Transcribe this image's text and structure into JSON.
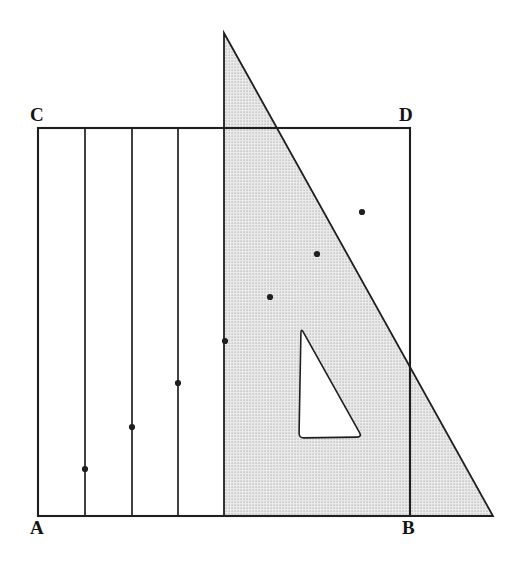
{
  "figure": {
    "background_color": "#ffffff",
    "line_color": "#1f1f1f",
    "shade_avg_color": "#dcdcdc",
    "rectangle": {
      "x1": 38,
      "y1": 128,
      "x2": 410,
      "y2": 516
    },
    "vertical_lines_x": [
      85,
      132,
      178
    ],
    "set_square": {
      "apex": [
        224,
        33
      ],
      "bottom_left": [
        224,
        516
      ],
      "bottom_right": [
        493,
        516
      ],
      "cutout": {
        "top": [
          301,
          328
        ],
        "bottom_left": [
          299,
          438
        ],
        "bottom_right": [
          362,
          437
        ],
        "corner_radius": 5
      }
    },
    "dots": [
      [
        85,
        469
      ],
      [
        132,
        427
      ],
      [
        178,
        383
      ],
      [
        225,
        341
      ],
      [
        270,
        297
      ],
      [
        317,
        254
      ],
      [
        362,
        212
      ]
    ],
    "dot_radius": 3.1,
    "stroke_widths": {
      "rectangle": 2.1,
      "vertical_line": 1.7,
      "set_square": 1.8,
      "cutout": 1.6
    },
    "labels": {
      "C": {
        "text": "C",
        "x": 30,
        "y": 105
      },
      "D": {
        "text": "D",
        "x": 399,
        "y": 105
      },
      "A": {
        "text": "A",
        "x": 30,
        "y": 518
      },
      "B": {
        "text": "B",
        "x": 402,
        "y": 518
      }
    }
  }
}
